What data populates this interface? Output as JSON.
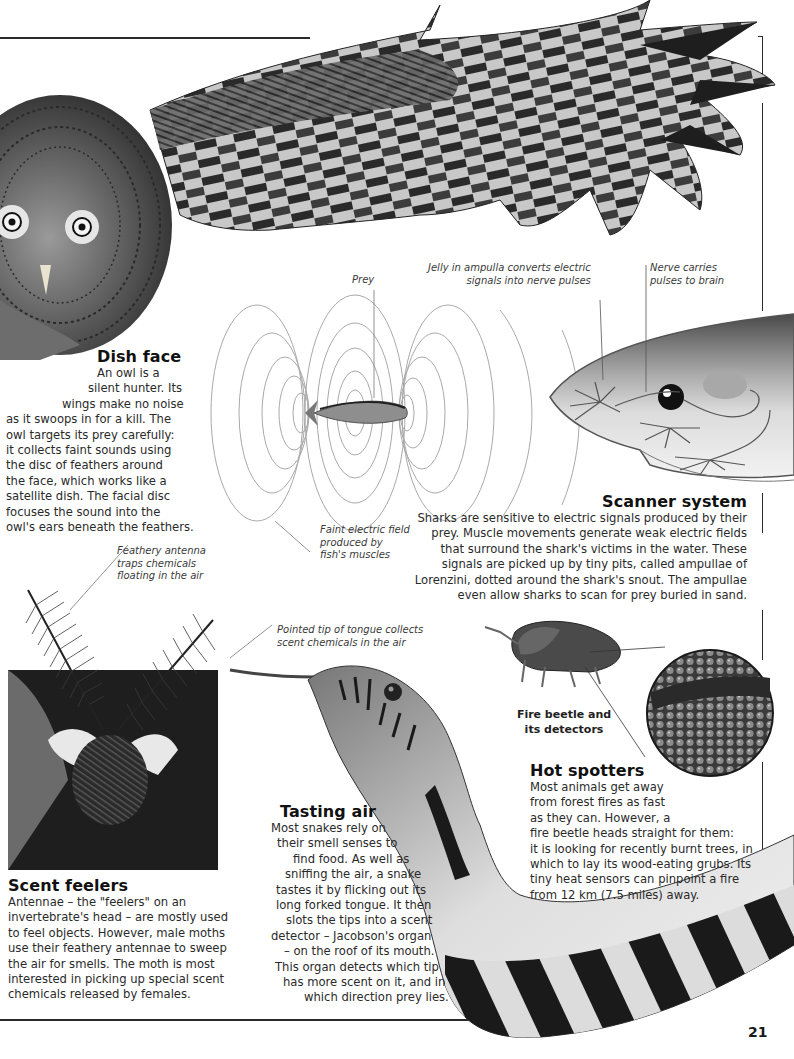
{
  "page": {
    "number": "21"
  },
  "sections": {
    "dish_face": {
      "heading": "Dish face",
      "lines": [
        "An owl is a",
        "silent hunter. Its",
        "wings make no noise",
        "as it swoops in for a kill. The",
        "owl targets its prey carefully:",
        "it collects faint sounds using",
        "the disc of feathers around",
        "the face, which works like a",
        "satellite dish. The facial disc",
        "focuses the sound into the",
        "owl's ears beneath the feathers."
      ]
    },
    "scanner_system": {
      "heading": "Scanner system",
      "lines": [
        "Sharks are sensitive to electric signals produced by their",
        "prey. Muscle movements generate weak electric fields",
        "that surround the shark's victims in the water. These",
        "signals are picked up by tiny pits, called ampullae of",
        "Lorenzini, dotted around the shark's snout. The ampullae",
        "even allow sharks to scan for prey buried in sand."
      ]
    },
    "scent_feelers": {
      "heading": "Scent feelers",
      "lines": [
        "Antennae – the \"feelers\" on an",
        "invertebrate's head – are mostly used",
        "to feel objects. However, male moths",
        "use their feathery antennae to sweep",
        "the air for smells. The moth is most",
        "interested in picking up special scent",
        "chemicals released by females."
      ]
    },
    "tasting_air": {
      "heading": "Tasting air",
      "lines": [
        "Most snakes rely on",
        "their smell senses to",
        "find food. As well as",
        "sniffing the air, a snake",
        "tastes it by flicking out its",
        "long forked tongue. It then",
        "slots the tips into a scent",
        "detector – Jacobson's organ",
        "– on the roof of its mouth.",
        "This organ detects which tip",
        "has more scent on it, and in",
        "which direction prey lies."
      ]
    },
    "hot_spotters": {
      "heading": "Hot spotters",
      "lines": [
        "Most animals get away",
        "from forest fires as fast",
        "as they can. However, a",
        "fire beetle heads straight for them:",
        "it is looking for recently burnt trees, in",
        "which to lay its wood-eating grubs. Its",
        "tiny heat sensors can pinpoint a fire",
        "from 12 km (7.5 miles) away."
      ]
    }
  },
  "captions": {
    "prey": [
      "Prey"
    ],
    "jelly": [
      "Jelly in ampulla converts electric",
      "signals into nerve pulses"
    ],
    "nerve": [
      "Nerve carries",
      "pulses to brain"
    ],
    "field": [
      "Faint electric field",
      "produced by",
      "fish's muscles"
    ],
    "antenna": [
      "Feathery antenna",
      "traps chemicals",
      "floating in the air"
    ],
    "tongue": [
      "Pointed tip of tongue collects",
      "scent chemicals in the air"
    ],
    "beetle": [
      "Fire beetle and",
      "its detectors"
    ]
  },
  "illustrations": {
    "owl": "great-grey-owl-photo",
    "shark": "shark-snout-diagram",
    "fish": "prey-fish",
    "moth": "moth-photo",
    "snake": "snake-photo",
    "beetle": "fire-beetle-photo",
    "detector_closeup": "beetle-detector-closeup"
  }
}
